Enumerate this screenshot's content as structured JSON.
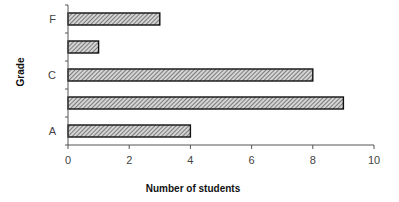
{
  "chart_data": {
    "type": "bar",
    "orientation": "horizontal",
    "title": "",
    "xlabel": "Number of students",
    "ylabel": "Grade",
    "categories": [
      "A",
      "B",
      "C",
      "D",
      "F"
    ],
    "category_tick_labels_shown": [
      "A",
      "",
      "C",
      "",
      "F"
    ],
    "values": [
      4,
      9,
      8,
      1,
      3
    ],
    "xlim": [
      0,
      10
    ],
    "xticks": [
      0,
      2,
      4,
      6,
      8,
      10
    ],
    "grid": false,
    "legend": null,
    "bar_fill": "diagonal-hatch",
    "colors": {
      "bar_fill": "#bdbdbd",
      "bar_hatch": "#555555",
      "bar_border": "#111111",
      "axis": "#555555"
    }
  },
  "axes": {
    "y_title": "Grade",
    "x_title": "Number of students"
  }
}
